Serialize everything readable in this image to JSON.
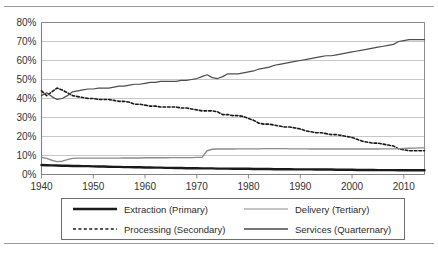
{
  "figure": {
    "has_top_rule": true,
    "has_bottom_rule": true
  },
  "legend": {
    "position": "below-plot",
    "entries": [
      {
        "label": "Extraction (Primary)",
        "style": "solid",
        "color": "#1a1a1a",
        "width": 2.4,
        "icon": "legend-line-icon"
      },
      {
        "label": "Delivery (Tertiary)",
        "style": "solid",
        "color": "#8a8a8a",
        "width": 1.0,
        "icon": "legend-line-icon"
      },
      {
        "label": "Processing (Secondary)",
        "style": "dotted",
        "color": "#1a1a1a",
        "width": 1.6,
        "icon": "legend-line-icon"
      },
      {
        "label": "Services (Quarternary)",
        "style": "solid",
        "color": "#4a4a4a",
        "width": 1.6,
        "icon": "legend-line-icon"
      }
    ]
  },
  "chart_data": {
    "type": "line",
    "title": "",
    "subtitle": "",
    "xlabel": "",
    "ylabel": "",
    "xlim": [
      1940,
      2014
    ],
    "ylim": [
      0,
      80
    ],
    "ytick_labels": [
      "0%",
      "10%",
      "20%",
      "30%",
      "40%",
      "50%",
      "60%",
      "70%",
      "80%"
    ],
    "ytick_values": [
      0,
      10,
      20,
      30,
      40,
      50,
      60,
      70,
      80
    ],
    "xtick_labels": [
      "1940",
      "1950",
      "1960",
      "1970",
      "1980",
      "1990",
      "2000",
      "2010"
    ],
    "xtick_values": [
      1940,
      1950,
      1960,
      1970,
      1980,
      1990,
      2000,
      2010
    ],
    "grid": {
      "horizontal": true,
      "vertical": false
    },
    "legend_position": "bottom",
    "x": [
      1940,
      1941,
      1942,
      1943,
      1944,
      1945,
      1946,
      1947,
      1948,
      1949,
      1950,
      1951,
      1952,
      1953,
      1954,
      1955,
      1956,
      1957,
      1958,
      1959,
      1960,
      1961,
      1962,
      1963,
      1964,
      1965,
      1966,
      1967,
      1968,
      1969,
      1970,
      1971,
      1972,
      1973,
      1974,
      1975,
      1976,
      1977,
      1978,
      1979,
      1980,
      1981,
      1982,
      1983,
      1984,
      1985,
      1986,
      1987,
      1988,
      1989,
      1990,
      1991,
      1992,
      1993,
      1994,
      1995,
      1996,
      1997,
      1998,
      1999,
      2000,
      2001,
      2002,
      2003,
      2004,
      2005,
      2006,
      2007,
      2008,
      2009,
      2010,
      2011,
      2012,
      2013,
      2014
    ],
    "series": [
      {
        "name": "Extraction (Primary)",
        "style": "solid",
        "color": "#1a1a1a",
        "width": 2.4,
        "values": [
          5.0,
          4.9,
          4.8,
          4.7,
          4.6,
          4.6,
          4.5,
          4.5,
          4.4,
          4.4,
          4.3,
          4.2,
          4.2,
          4.1,
          4.0,
          4.0,
          3.9,
          3.9,
          3.8,
          3.8,
          3.7,
          3.7,
          3.6,
          3.6,
          3.5,
          3.5,
          3.4,
          3.4,
          3.3,
          3.3,
          3.3,
          3.2,
          3.2,
          3.2,
          3.1,
          3.1,
          3.1,
          3.0,
          3.0,
          3.0,
          3.0,
          2.9,
          2.9,
          2.9,
          2.9,
          2.8,
          2.8,
          2.8,
          2.8,
          2.7,
          2.7,
          2.7,
          2.7,
          2.6,
          2.6,
          2.6,
          2.6,
          2.5,
          2.5,
          2.5,
          2.5,
          2.4,
          2.4,
          2.4,
          2.4,
          2.3,
          2.3,
          2.3,
          2.3,
          2.2,
          2.2,
          2.2,
          2.2,
          2.2,
          2.2
        ]
      },
      {
        "name": "Processing (Secondary)",
        "style": "dotted",
        "color": "#1a1a1a",
        "width": 1.6,
        "values": [
          44.0,
          41.5,
          43.5,
          45.5,
          44.5,
          43.0,
          41.5,
          41.0,
          40.5,
          40.0,
          40.0,
          39.5,
          39.5,
          39.5,
          39.0,
          38.5,
          38.5,
          38.0,
          37.0,
          37.0,
          36.5,
          36.0,
          36.0,
          35.5,
          35.5,
          35.5,
          35.5,
          35.0,
          35.0,
          34.5,
          34.0,
          33.5,
          33.5,
          33.5,
          33.0,
          31.5,
          31.5,
          31.0,
          31.0,
          30.5,
          29.5,
          28.5,
          27.0,
          26.5,
          26.5,
          26.0,
          25.5,
          25.0,
          25.0,
          24.5,
          24.0,
          23.0,
          22.5,
          22.0,
          22.0,
          21.5,
          21.0,
          21.0,
          20.5,
          20.0,
          19.5,
          18.5,
          17.5,
          17.0,
          16.5,
          16.5,
          16.0,
          15.5,
          15.0,
          13.5,
          13.0,
          12.5,
          12.5,
          12.5,
          12.5
        ]
      },
      {
        "name": "Delivery (Tertiary)",
        "style": "solid",
        "color": "#4d4d4d",
        "width": 1.2,
        "values": [
          41.5,
          43.0,
          41.0,
          39.5,
          40.0,
          41.5,
          43.5,
          44.0,
          44.5,
          45.0,
          45.0,
          45.5,
          45.5,
          45.5,
          46.0,
          46.5,
          46.5,
          47.0,
          47.5,
          47.5,
          48.0,
          48.5,
          48.5,
          49.0,
          49.0,
          49.0,
          49.0,
          49.5,
          49.5,
          50.0,
          50.5,
          51.5,
          52.5,
          51.0,
          50.5,
          51.5,
          53.0,
          53.0,
          53.0,
          53.5,
          54.0,
          54.5,
          55.5,
          56.0,
          56.5,
          57.5,
          58.0,
          58.5,
          59.0,
          59.5,
          60.0,
          60.5,
          61.0,
          61.5,
          62.0,
          62.5,
          62.5,
          63.0,
          63.5,
          64.0,
          64.5,
          65.0,
          65.5,
          66.0,
          66.5,
          67.0,
          67.5,
          68.0,
          68.5,
          70.0,
          70.5,
          71.0,
          71.0,
          71.0,
          71.0
        ]
      },
      {
        "name": "Services (Quarternary)",
        "style": "solid",
        "color": "#8c8c8c",
        "width": 1.4,
        "values": [
          9.0,
          8.5,
          7.5,
          6.8,
          7.0,
          7.8,
          8.5,
          8.6,
          8.6,
          8.6,
          8.6,
          8.6,
          8.6,
          8.6,
          8.6,
          8.6,
          8.7,
          8.7,
          8.7,
          8.7,
          8.8,
          8.8,
          8.8,
          8.8,
          8.8,
          8.9,
          8.9,
          8.9,
          8.9,
          8.9,
          9.0,
          9.0,
          12.5,
          13.3,
          13.4,
          13.4,
          13.4,
          13.4,
          13.5,
          13.5,
          13.5,
          13.5,
          13.5,
          13.6,
          13.6,
          13.6,
          13.6,
          13.6,
          13.5,
          13.5,
          13.5,
          13.5,
          13.4,
          13.4,
          13.4,
          13.4,
          13.4,
          13.4,
          13.4,
          13.4,
          13.4,
          13.4,
          13.4,
          13.4,
          13.4,
          13.4,
          13.5,
          13.5,
          13.5,
          13.6,
          13.7,
          13.8,
          13.9,
          14.0,
          14.0
        ]
      }
    ]
  }
}
